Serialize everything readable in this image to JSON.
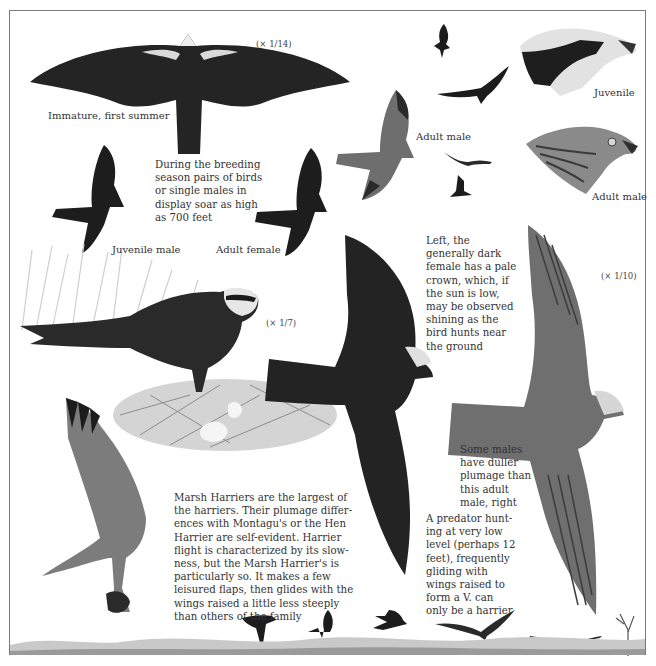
{
  "plate": {
    "subject": "Marsh Harrier",
    "scales": {
      "top": "(× 1/14)",
      "perched": "(× 1/7)",
      "right": "(× 1/10)"
    },
    "labels": {
      "immature": "Immature, first summer",
      "juvenile_male": "Juvenile male",
      "adult_female": "Adult female",
      "adult_male_flight": "Adult male",
      "head_juvenile": "Juvenile",
      "head_adult_male": "Adult male"
    },
    "captions": {
      "display": "During the breeding\nseason pairs of birds\nor single males in\ndisplay soar as high\nas 700 feet",
      "female_crown": "Left, the\ngenerally dark\nfemale has a pale\ncrown, which, if\nthe sun is low,\nmay be observed\nshining as the\nbird hunts near\nthe ground",
      "duller_males": "Some males\nhave duller\nplumage than\nthis adult\nmale, right",
      "main_text": "Marsh Harriers are the largest of\nthe harriers. Their plumage differ-\nences with Montagu's or the Hen\nHarrier are self-evident. Harrier\nflight is characterized by its slow-\nness, but the Marsh Harrier's is\nparticularly so. It makes a few\nleisured flaps, then glides with the\nwings raised a little less steeply\nthan others of the family",
      "predator": "A predator hunt-\ning at very low\nlevel (perhaps 12\nfeet), frequently\ngliding with\nwings raised to\nform a V. can\nonly be a harrier"
    },
    "colors": {
      "ink": "#1a1a1a",
      "dark_bird": "#222222",
      "grey_bird": "#6e6e6e",
      "pale": "#e8e8e8",
      "frame": "#7a7a7a"
    }
  }
}
